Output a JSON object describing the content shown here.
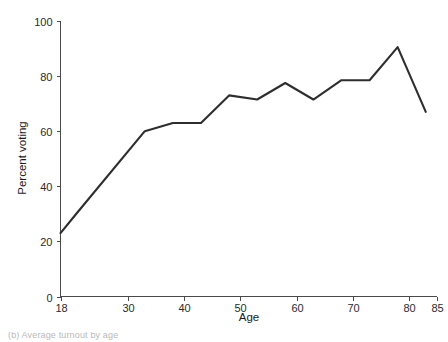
{
  "chart_data": {
    "type": "line",
    "title": "",
    "xlabel": "Age",
    "ylabel": "Percent voting",
    "xlim": [
      18,
      85
    ],
    "ylim": [
      0,
      100
    ],
    "grid": false,
    "legend": "none",
    "xticks": [
      18,
      30,
      40,
      50,
      60,
      70,
      80,
      85
    ],
    "xtick_labels": [
      "18",
      "30",
      "40",
      "50",
      "60",
      "70",
      "80",
      "85"
    ],
    "yticks": [
      0,
      20,
      40,
      60,
      80,
      100
    ],
    "ytick_labels": [
      "0",
      "20",
      "40",
      "60",
      "80",
      "100"
    ],
    "series": [
      {
        "name": "Percent voting",
        "color": "#2e2e2e",
        "x": [
          18,
          21,
          33,
          38,
          43,
          48,
          53,
          58,
          63,
          68,
          73,
          78,
          83
        ],
        "values": [
          23,
          30.5,
          60,
          63,
          63,
          73,
          71.5,
          77.5,
          71.5,
          78.5,
          78.5,
          90.5,
          67
        ]
      }
    ]
  },
  "axis_labels": {
    "x_title": "Age",
    "y_title": "Percent voting"
  },
  "caption": {
    "text": "(b) Average turnout by age"
  },
  "colors": {
    "line": "#2e2e2e",
    "axis": "#4a4a4a",
    "text": "#1a1a1a",
    "background": "#ffffff"
  }
}
